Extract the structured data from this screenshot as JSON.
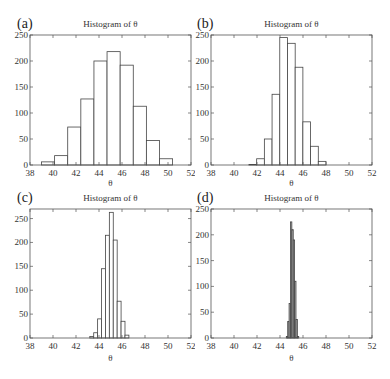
{
  "chart_data": [
    {
      "type": "bar",
      "panel": "(a)",
      "title": "Histogram of θ",
      "xlabel": "θ",
      "ylabel": "",
      "xlim": [
        38,
        52
      ],
      "ylim": [
        0,
        250
      ],
      "xticks": [
        38,
        40,
        42,
        44,
        46,
        48,
        50,
        52
      ],
      "yticks": [
        0,
        50,
        100,
        150,
        200,
        250
      ],
      "bin_edges": [
        39.0,
        40.14,
        41.28,
        42.42,
        43.56,
        44.7,
        45.84,
        46.98,
        48.12,
        49.26,
        50.4
      ],
      "values": [
        6,
        18,
        73,
        127,
        200,
        218,
        192,
        113,
        47,
        12
      ],
      "fill": "#ffffff"
    },
    {
      "type": "bar",
      "panel": "(b)",
      "title": "Histogram of θ",
      "xlabel": "θ",
      "ylabel": "",
      "xlim": [
        38,
        52
      ],
      "ylim": [
        0,
        250
      ],
      "xticks": [
        38,
        40,
        42,
        44,
        46,
        48,
        50,
        52
      ],
      "yticks": [
        0,
        50,
        100,
        150,
        200,
        250
      ],
      "bin_edges": [
        41.3,
        41.97,
        42.64,
        43.31,
        43.98,
        44.65,
        45.32,
        45.99,
        46.66,
        47.33,
        48.0
      ],
      "values": [
        1,
        12,
        50,
        136,
        245,
        234,
        188,
        83,
        36,
        7
      ],
      "fill": "#ffffff"
    },
    {
      "type": "bar",
      "panel": "(c)",
      "title": "Histogram of θ",
      "xlabel": "θ",
      "ylabel": "",
      "xlim": [
        38,
        52
      ],
      "ylim": [
        0,
        270
      ],
      "xticks": [
        38,
        40,
        42,
        44,
        46,
        48,
        50,
        52
      ],
      "yticks": [
        0,
        50,
        100,
        150,
        200,
        250
      ],
      "bin_edges": [
        43.2,
        43.54,
        43.88,
        44.22,
        44.56,
        44.9,
        45.24,
        45.58,
        45.92,
        46.26,
        46.6
      ],
      "values": [
        3,
        11,
        40,
        145,
        215,
        263,
        205,
        77,
        35,
        6
      ],
      "fill": "#ffffff"
    },
    {
      "type": "bar",
      "panel": "(d)",
      "title": "Histogram of θ",
      "xlabel": "θ",
      "ylabel": "",
      "xlim": [
        38,
        52
      ],
      "ylim": [
        0,
        250
      ],
      "xticks": [
        38,
        40,
        42,
        44,
        46,
        48,
        50,
        52
      ],
      "yticks": [
        0,
        50,
        100,
        150,
        200,
        250
      ],
      "bin_edges": [
        44.55,
        44.67,
        44.79,
        44.91,
        45.03,
        45.15,
        45.27,
        45.39,
        45.51,
        45.63
      ],
      "values": [
        3,
        32,
        67,
        225,
        210,
        190,
        110,
        36,
        3
      ],
      "fill": "#b0b0b0"
    }
  ]
}
